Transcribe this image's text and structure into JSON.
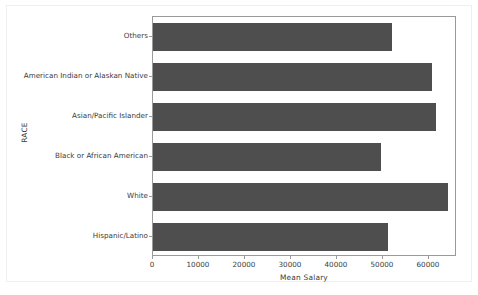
{
  "chart_data": {
    "type": "bar",
    "orientation": "horizontal",
    "title": "",
    "xlabel": "Mean Salary",
    "ylabel": "RACE",
    "categories": [
      "Others",
      "American Indian or Alaskan Native",
      "Asian/Pacific Islander",
      "Black or African American",
      "White",
      "Hispanic/Latino"
    ],
    "values": [
      51900,
      60650,
      61500,
      49600,
      64200,
      51000
    ],
    "xticks": [
      0,
      10000,
      20000,
      30000,
      40000,
      50000,
      60000
    ],
    "xtick_labels": [
      "0",
      "10000",
      "20000",
      "30000",
      "40000",
      "50000",
      "60000"
    ],
    "xlim": [
      0,
      66100
    ],
    "grid": false,
    "legend": false,
    "bar_color": "#4e4e4e",
    "axes_color": "#9a9a9a",
    "text_color": "#3b3b3b"
  }
}
